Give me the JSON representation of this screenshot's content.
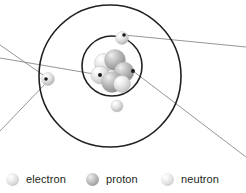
{
  "diagram": {
    "name": "bohr-atomic-model",
    "title": "",
    "background_color": "#ffffff",
    "orbit_color": "#231f20",
    "leader_line_color": "#8a8a8a",
    "orbits": [
      {
        "name": "outer-electron-shell",
        "cx": 110,
        "cy": 76,
        "r": 71,
        "stroke_width": 1.6
      },
      {
        "name": "inner-electron-shell",
        "cx": 112,
        "cy": 66,
        "r": 30,
        "stroke_width": 1.6
      }
    ],
    "electrons": [
      {
        "name": "electron-top",
        "cx": 122,
        "cy": 38,
        "r": 6.5
      },
      {
        "name": "electron-left",
        "cx": 48,
        "cy": 79,
        "r": 6.5
      },
      {
        "name": "electron-bottom",
        "cx": 117,
        "cy": 106,
        "r": 6.0
      }
    ],
    "nucleus": {
      "name": "nucleus-cluster",
      "cx": 112,
      "cy": 72,
      "particles": [
        {
          "name": "neutron",
          "type": "neutron",
          "cx": 104,
          "cy": 63,
          "r": 9.5,
          "z": 1
        },
        {
          "name": "proton",
          "type": "proton",
          "cx": 115,
          "cy": 60,
          "r": 10.5,
          "z": 2
        },
        {
          "name": "neutron",
          "type": "neutron",
          "cx": 100,
          "cy": 75,
          "r": 9.0,
          "z": 3
        },
        {
          "name": "proton",
          "type": "proton",
          "cx": 124,
          "cy": 72,
          "r": 10.0,
          "z": 4
        },
        {
          "name": "proton",
          "type": "proton",
          "cx": 112,
          "cy": 82,
          "r": 10.5,
          "z": 5
        },
        {
          "name": "neutron",
          "type": "neutron",
          "cx": 122,
          "cy": 84,
          "r": 8.5,
          "z": 6
        }
      ]
    },
    "leader_lines": [
      {
        "name": "leader-line-electron-top",
        "x1": 124,
        "y1": 35,
        "x2": 246,
        "y2": 47
      },
      {
        "name": "leader-line-electron-left-up",
        "x1": 46,
        "y1": 77,
        "x2": 0,
        "y2": 45
      },
      {
        "name": "leader-line-electron-left-down",
        "x1": 47,
        "y1": 82,
        "x2": 0,
        "y2": 131
      },
      {
        "name": "leader-line-proton",
        "x1": 100,
        "y1": 75,
        "x2": 0,
        "y2": 58
      },
      {
        "name": "leader-line-neutron",
        "x1": 133,
        "y1": 71,
        "x2": 246,
        "y2": 157
      }
    ],
    "anchor_dots": [
      {
        "name": "anchor-dot-electron-top",
        "cx": 124,
        "cy": 35,
        "r": 1.8
      },
      {
        "name": "anchor-dot-electron-left",
        "cx": 46,
        "cy": 79,
        "r": 1.8
      },
      {
        "name": "anchor-dot-proton",
        "cx": 100,
        "cy": 75,
        "r": 2.0
      },
      {
        "name": "anchor-dot-neutron",
        "cx": 133,
        "cy": 71,
        "r": 2.0
      }
    ]
  },
  "legend": {
    "name": "particle-legend",
    "items": [
      {
        "label": "electron",
        "swatch": "electron-sphere-icon",
        "color": "#dcdcdc"
      },
      {
        "label": "proton",
        "swatch": "proton-sphere-icon",
        "color": "#b6b6b6"
      },
      {
        "label": "neutron",
        "swatch": "neutron-sphere-icon",
        "color": "#e0e0e0"
      }
    ]
  }
}
